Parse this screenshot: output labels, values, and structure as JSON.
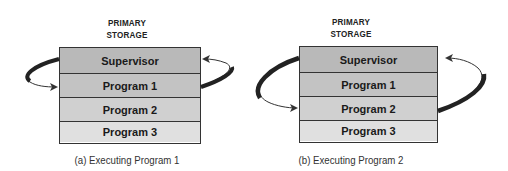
{
  "panels": [
    {
      "title_line1": "PRIMARY",
      "title_line2": "STORAGE",
      "rows": [
        {
          "label": "Supervisor",
          "color": "#b9b9b9"
        },
        {
          "label": "Program 1",
          "color": "#c3c3c3"
        },
        {
          "label": "Program 2",
          "color": "#d0d0d0"
        },
        {
          "label": "Program 3",
          "color": "#e0e0e0"
        }
      ],
      "caption": "(a)  Executing Program 1"
    },
    {
      "title_line1": "PRIMARY",
      "title_line2": "STORAGE",
      "rows": [
        {
          "label": "Supervisor",
          "color": "#b9b9b9"
        },
        {
          "label": "Program 1",
          "color": "#c3c3c3"
        },
        {
          "label": "Program 2",
          "color": "#d0d0d0"
        },
        {
          "label": "Program 3",
          "color": "#e0e0e0"
        }
      ],
      "caption": "(b)  Executing Program 2"
    }
  ]
}
